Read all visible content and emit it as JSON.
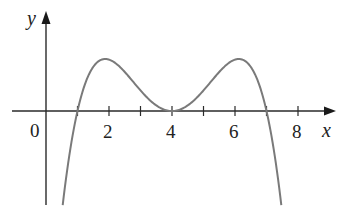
{
  "chart_data": {
    "type": "line",
    "title": "",
    "xlabel": "x",
    "ylabel": "y",
    "function": "f(x) = -(x-1)(x-4)^2(x-7)",
    "roots": [
      1,
      4,
      7
    ],
    "local_maxima": [
      {
        "x": 2,
        "y": 20
      },
      {
        "x": 6,
        "y": 20
      }
    ],
    "local_minimum": {
      "x": 4,
      "y": 0
    },
    "origin_label": "0",
    "x_ticks": [
      1,
      2,
      3,
      4,
      5,
      6,
      7,
      8
    ],
    "x_tick_labels": [
      {
        "value": 2,
        "label": "2"
      },
      {
        "value": 4,
        "label": "4"
      },
      {
        "value": 6,
        "label": "6"
      },
      {
        "value": 8,
        "label": "8"
      }
    ],
    "xlim": [
      -1.4,
      9.2
    ],
    "ylim": [
      -37,
      38
    ],
    "grid": false,
    "legend": null,
    "series": [
      {
        "name": "f(x)",
        "x": [
          0.5,
          1,
          1.5,
          2,
          2.5,
          3,
          3.5,
          4,
          4.5,
          5,
          5.5,
          6,
          6.5,
          7,
          7.5
        ],
        "values": [
          -35.4,
          0,
          15.2,
          20,
          17.4,
          9,
          2.3,
          0,
          2.3,
          9,
          17.4,
          20,
          15.2,
          0,
          -35.4
        ]
      }
    ]
  },
  "labels": {
    "origin": "0",
    "x_axis": "x",
    "y_axis": "y",
    "tick_2": "2",
    "tick_4": "4",
    "tick_6": "6",
    "tick_8": "8"
  }
}
